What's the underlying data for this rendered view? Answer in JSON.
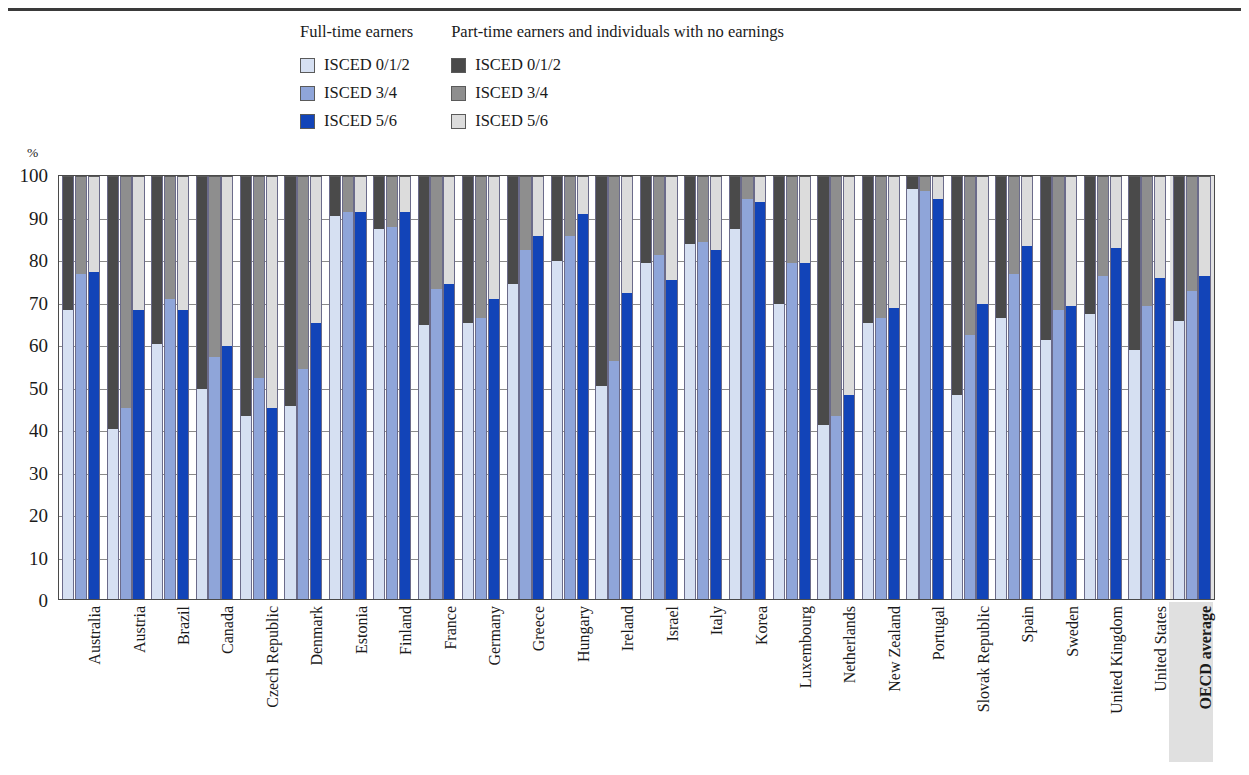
{
  "legend": {
    "columns": [
      {
        "title": "Full-time earners",
        "items": [
          {
            "label": "ISCED 0/1/2",
            "color": "#d6e0f2"
          },
          {
            "label": "ISCED 3/4",
            "color": "#8fa5d9"
          },
          {
            "label": "ISCED 5/6",
            "color": "#1244b8"
          }
        ]
      },
      {
        "title": "Part-time earners and individuals with no earnings",
        "items": [
          {
            "label": "ISCED 0/1/2",
            "color": "#4a4a4a"
          },
          {
            "label": "ISCED 3/4",
            "color": "#8e8e8e"
          },
          {
            "label": "ISCED 5/6",
            "color": "#dcdcdc"
          }
        ]
      }
    ]
  },
  "axis": {
    "unit_label": "%",
    "yticks": [
      "100",
      "90",
      "80",
      "70",
      "60",
      "50",
      "40",
      "30",
      "20",
      "10",
      "0"
    ],
    "ymin": 0,
    "ymax": 100
  },
  "chart_data": {
    "type": "bar",
    "title": "",
    "subtitle": "",
    "xlabel": "",
    "ylabel": "%",
    "ylim": [
      0,
      100
    ],
    "grid": true,
    "legend_position": "top",
    "stacked": true,
    "bars_per_category": 3,
    "bar_names": [
      "ISCED 0/1/2",
      "ISCED 3/4",
      "ISCED 5/6"
    ],
    "bottom_colors": [
      "#d6e0f2",
      "#8fa5d9",
      "#1244b8"
    ],
    "top_colors": [
      "#4a4a4a",
      "#8e8e8e",
      "#dcdcdc"
    ],
    "note": "Each country shows 3 stacked bars. Value = share of full-time earners; remainder to 100 = part-time earners and individuals with no earnings.",
    "categories": [
      "Australia",
      "Austria",
      "Brazil",
      "Canada",
      "Czech Republic",
      "Denmark",
      "Estonia",
      "Finland",
      "France",
      "Germany",
      "Greece",
      "Hungary",
      "Ireland",
      "Israel",
      "Italy",
      "Korea",
      "Luxembourg",
      "Netherlands",
      "New Zealand",
      "Portugal",
      "Slovak Republic",
      "Spain",
      "Sweden",
      "United Kingdom",
      "United States",
      "OECD average"
    ],
    "highlight_category": "OECD average",
    "series": [
      {
        "name": "ISCED 0/1/2",
        "values": [
          68.5,
          40.5,
          60.5,
          50.0,
          43.5,
          46.0,
          90.5,
          87.5,
          65.0,
          65.5,
          74.5,
          80.0,
          50.5,
          79.5,
          84.0,
          87.5,
          70.0,
          41.5,
          65.5,
          97.0,
          48.5,
          66.5,
          61.5,
          67.5,
          59.0,
          66.0
        ]
      },
      {
        "name": "ISCED 3/4",
        "values": [
          77.0,
          45.5,
          71.0,
          57.5,
          52.5,
          54.5,
          91.5,
          88.0,
          73.5,
          66.5,
          82.5,
          86.0,
          56.5,
          81.5,
          84.5,
          94.5,
          79.5,
          43.5,
          66.5,
          96.5,
          62.5,
          77.0,
          68.5,
          76.5,
          69.5,
          73.0
        ]
      },
      {
        "name": "ISCED 5/6",
        "values": [
          77.5,
          68.5,
          68.5,
          60.0,
          45.5,
          65.5,
          91.5,
          91.5,
          74.5,
          71.0,
          86.0,
          91.0,
          72.5,
          75.5,
          82.5,
          94.0,
          79.5,
          48.5,
          69.0,
          94.5,
          70.0,
          83.5,
          69.5,
          83.0,
          76.0,
          76.5
        ]
      }
    ]
  }
}
